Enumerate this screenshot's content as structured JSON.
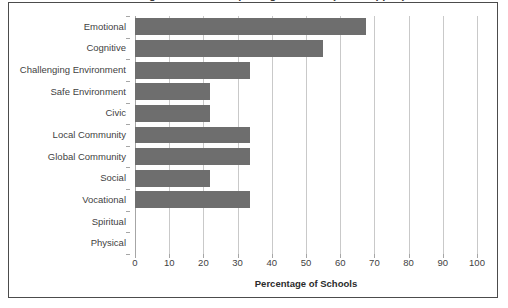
{
  "chart_data": {
    "type": "bar",
    "orientation": "horizontal",
    "title": "Percentage of Schools Reporting Each Aim (title cropped)",
    "xlabel": "Percentage of Schools",
    "ylabel": "",
    "xlim": [
      0,
      100
    ],
    "xticks": [
      0,
      10,
      20,
      30,
      40,
      50,
      60,
      70,
      80,
      90,
      100
    ],
    "xtick_labels": [
      "0",
      "10",
      "20",
      "30",
      "40",
      "50",
      "60",
      "70",
      "80",
      "90",
      "100"
    ],
    "grid": "vertical",
    "legend": "none",
    "bar_color": "#6e6e6e",
    "categories": [
      "Emotional",
      "Cognitive",
      "Challenging Environment",
      "Safe Environment",
      "Civic",
      "Local Community",
      "Global Community",
      "Social",
      "Vocational",
      "Spiritual",
      "Physical"
    ],
    "values": [
      67.5,
      55,
      33.5,
      22,
      22,
      33.5,
      33.5,
      22,
      33.5,
      0,
      0
    ]
  },
  "colors": {
    "bar": "#6e6e6e",
    "gridline": "#c9c9c9",
    "axis": "#a6a6a6",
    "border": "#4c4c4c",
    "text": "#3f3f3f",
    "background": "#ffffff"
  }
}
